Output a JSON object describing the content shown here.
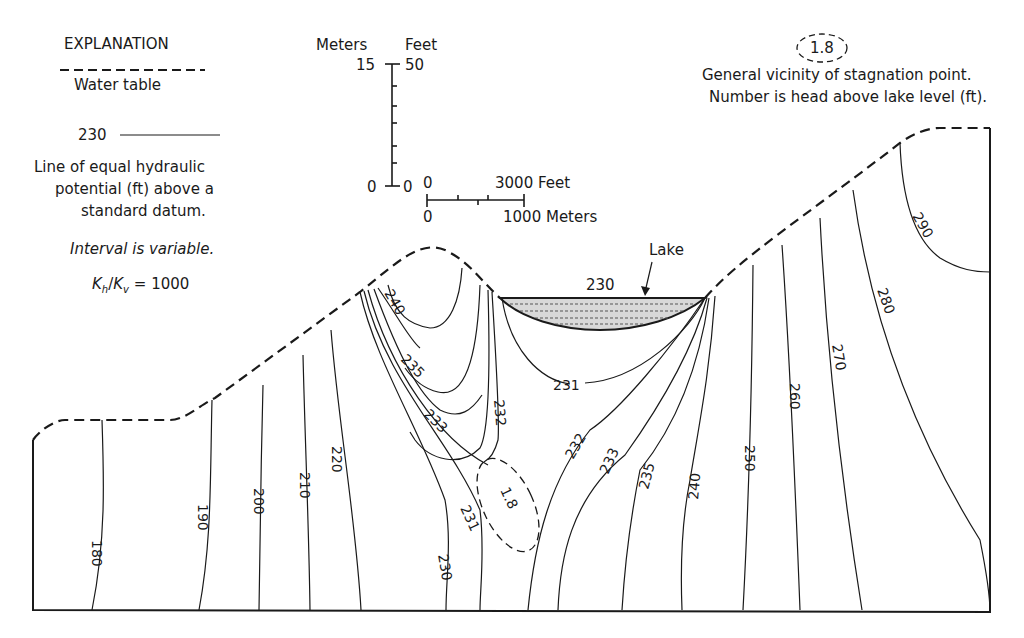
{
  "legend": {
    "title": "EXPLANATION",
    "water_table_label": "Water table",
    "equipotential_sample_value": "230",
    "equipotential_desc_line1": "Line of equal hydraulic",
    "equipotential_desc_line2": "potential (ft) above a",
    "equipotential_desc_line3": "standard datum.",
    "interval_note": "Interval is variable.",
    "anisotropy": "Kh/Kv = 1000",
    "anisotropy_k1": "K",
    "anisotropy_sub1": "h",
    "anisotropy_k2": "K",
    "anisotropy_sub2": "v",
    "anisotropy_value": "= 1000"
  },
  "vertical_scale": {
    "left_unit": "Meters",
    "right_unit": "Feet",
    "left_top": "15",
    "right_top": "50",
    "left_bottom": "0",
    "right_bottom": "0"
  },
  "horizontal_scale": {
    "top_zero": "0",
    "top_label": "3000 Feet",
    "bottom_zero": "0",
    "bottom_label": "1000 Meters"
  },
  "stagnation": {
    "sample_value": "1.8",
    "desc_line1": "General vicinity of stagnation point.",
    "desc_line2": "Number is head above lake level (ft)."
  },
  "section": {
    "lake_label": "Lake",
    "lake_level": "230",
    "stagnation_value": "1.8",
    "contours": [
      {
        "label": "180"
      },
      {
        "label": "190"
      },
      {
        "label": "200"
      },
      {
        "label": "210"
      },
      {
        "label": "220"
      },
      {
        "label": "230"
      },
      {
        "label": "231"
      },
      {
        "label": "233"
      },
      {
        "label": "235"
      },
      {
        "label": "240"
      },
      {
        "label": "232"
      },
      {
        "label": "231"
      },
      {
        "label": "232"
      },
      {
        "label": "233"
      },
      {
        "label": "235"
      },
      {
        "label": "240"
      },
      {
        "label": "250"
      },
      {
        "label": "260"
      },
      {
        "label": "270"
      },
      {
        "label": "280"
      },
      {
        "label": "290"
      }
    ]
  }
}
